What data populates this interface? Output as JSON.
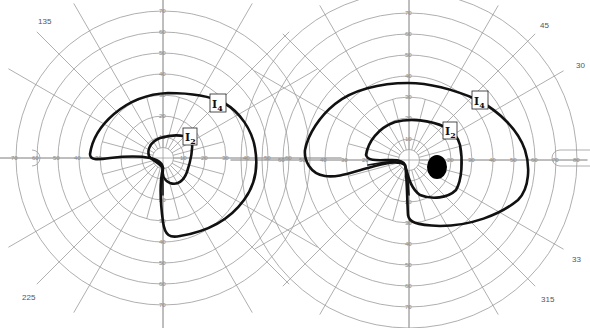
{
  "figure": {
    "type": "goldmann-visual-field-perimetry",
    "panels": [
      {
        "id": "left-eye",
        "center": [
          163,
          158
        ],
        "px_per_10deg": 21,
        "rings_deg": [
          10,
          20,
          30,
          40,
          50,
          60,
          70
        ],
        "horizontal_tick_labels_left": [
          "70",
          "60",
          "50",
          "40",
          "30"
        ],
        "horizontal_tick_labels_right": [
          "10",
          "20",
          "30",
          "40",
          "50",
          "60"
        ],
        "vertical_tick_labels_up": [
          "10",
          "20",
          "30",
          "40",
          "50",
          "60",
          "70"
        ],
        "vertical_tick_labels_down": [
          "10",
          "20",
          "30",
          "40",
          "50",
          "60",
          "70"
        ],
        "meridian_labels": [
          {
            "text": "135",
            "x": 38,
            "y": 24
          },
          {
            "text": "225",
            "x": 22,
            "y": 300
          }
        ],
        "isopters": [
          {
            "name": "I4",
            "label": "I",
            "sub": "4",
            "label_pos": [
              218,
              103
            ]
          },
          {
            "name": "I2",
            "label": "I",
            "sub": "2",
            "label_pos": [
              189,
              137
            ]
          }
        ]
      },
      {
        "id": "right-eye",
        "center": [
          409,
          160
        ],
        "px_per_10deg": 21,
        "rings_deg": [
          10,
          20,
          30,
          40,
          50,
          60,
          70,
          80
        ],
        "horizontal_tick_labels_left": [
          "60",
          "50",
          "40",
          "30",
          "20"
        ],
        "horizontal_tick_labels_right": [
          "20",
          "30",
          "40",
          "50",
          "60",
          "70",
          "80"
        ],
        "vertical_tick_labels_up": [
          "10",
          "20",
          "30",
          "40",
          "50",
          "60",
          "70"
        ],
        "vertical_tick_labels_down": [
          "20",
          "30",
          "40",
          "50",
          "60",
          "70"
        ],
        "meridian_labels": [
          {
            "text": "45",
            "x": 540,
            "y": 28
          },
          {
            "text": "30",
            "x": 576,
            "y": 68
          },
          {
            "text": "33",
            "x": 572,
            "y": 262
          },
          {
            "text": "315",
            "x": 541,
            "y": 302
          }
        ],
        "isopters": [
          {
            "name": "I4",
            "label": "I",
            "sub": "4",
            "label_pos": [
              480,
              100
            ]
          },
          {
            "name": "I2",
            "label": "I",
            "sub": "2",
            "label_pos": [
              450,
              130
            ]
          }
        ],
        "scotoma": {
          "type": "blind-spot-enlarged",
          "center": [
            437,
            167
          ],
          "rx": 10,
          "ry": 12,
          "fill": "#000000"
        }
      }
    ],
    "colors": {
      "grid": "#9a9a9a",
      "isopter": "#111111",
      "background": "#ffffff"
    }
  }
}
